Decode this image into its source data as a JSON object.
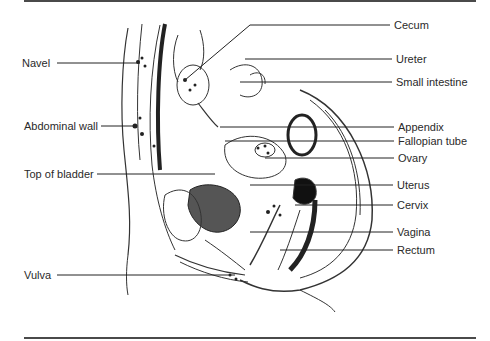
{
  "figure": {
    "colors": {
      "ink": "#2a2a2a",
      "rule": "#4a4a4a",
      "background": "#ffffff"
    }
  },
  "labels_left": [
    {
      "id": "navel",
      "text": "Navel",
      "x": 22,
      "y": 57,
      "line": [
        57,
        63,
        140,
        63
      ]
    },
    {
      "id": "abdominal-wall",
      "text": "Abdominal wall",
      "x": 24,
      "y": 120,
      "line": [
        101,
        126,
        135,
        126
      ]
    },
    {
      "id": "top-of-bladder",
      "text": "Top of bladder",
      "x": 24,
      "y": 168,
      "line": [
        97,
        174,
        215,
        174
      ]
    },
    {
      "id": "vulva",
      "text": "Vulva",
      "x": 24,
      "y": 269,
      "line": [
        57,
        275,
        235,
        275
      ]
    }
  ],
  "labels_right": [
    {
      "id": "cecum",
      "text": "Cecum",
      "x": 394,
      "y": 20,
      "line": [
        390,
        25,
        250,
        25
      ],
      "diag": [
        250,
        25,
        185,
        80
      ]
    },
    {
      "id": "ureter",
      "text": "Ureter",
      "x": 396,
      "y": 53,
      "line": [
        392,
        59,
        245,
        59
      ]
    },
    {
      "id": "small-intestine",
      "text": "Small intestine",
      "x": 396,
      "y": 76,
      "line": [
        392,
        82,
        240,
        82
      ]
    },
    {
      "id": "appendix",
      "text": "Appendix",
      "x": 398,
      "y": 121,
      "line": [
        394,
        127,
        220,
        127
      ]
    },
    {
      "id": "fallopian-tube",
      "text": "Fallopian tube",
      "x": 398,
      "y": 135,
      "line": [
        394,
        141,
        225,
        141
      ]
    },
    {
      "id": "ovary",
      "text": "Ovary",
      "x": 398,
      "y": 152,
      "line": [
        394,
        158,
        265,
        158
      ]
    },
    {
      "id": "uterus",
      "text": "Uterus",
      "x": 397,
      "y": 179,
      "line": [
        393,
        185,
        250,
        185
      ]
    },
    {
      "id": "cervix",
      "text": "Cervix",
      "x": 397,
      "y": 199,
      "line": [
        393,
        205,
        295,
        205
      ]
    },
    {
      "id": "vagina",
      "text": "Vagina",
      "x": 397,
      "y": 226,
      "line": [
        393,
        232,
        250,
        232
      ]
    },
    {
      "id": "rectum",
      "text": "Rectum",
      "x": 397,
      "y": 244,
      "line": [
        393,
        250,
        280,
        250
      ]
    }
  ]
}
